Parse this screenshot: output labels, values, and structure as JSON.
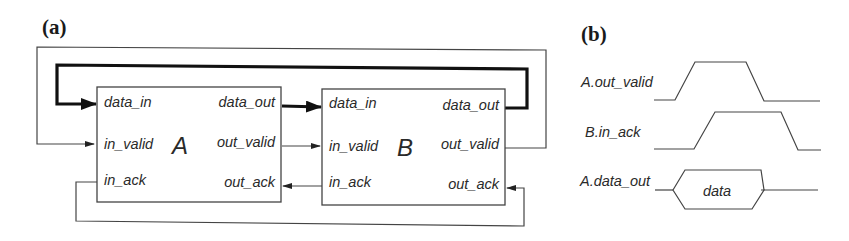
{
  "panels": {
    "a": {
      "label": "(a)",
      "blocks": [
        {
          "name": "A",
          "ports": {
            "data_in": "data_in",
            "data_out": "data_out",
            "in_valid": "in_valid",
            "out_valid": "out_valid",
            "in_ack": "in_ack",
            "out_ack": "out_ack"
          }
        },
        {
          "name": "B",
          "ports": {
            "data_in": "data_in",
            "data_out": "data_out",
            "in_valid": "in_valid",
            "out_valid": "out_valid",
            "in_ack": "in_ack",
            "out_ack": "out_ack"
          }
        }
      ],
      "connections": [
        {
          "from": "A.data_out",
          "to": "B.data_in",
          "style": "thick"
        },
        {
          "from": "B.data_out",
          "to": "A.data_in",
          "style": "thick"
        },
        {
          "from": "A.out_valid",
          "to": "B.in_valid",
          "style": "thin"
        },
        {
          "from": "B.out_valid",
          "to": "A.in_valid",
          "style": "thin"
        },
        {
          "from": "B.in_ack",
          "to": "A.out_ack",
          "style": "thin"
        },
        {
          "from": "A.in_ack",
          "to": "B.out_ack",
          "style": "thin"
        }
      ]
    },
    "b": {
      "label": "(b)",
      "signals": [
        {
          "name": "A.out_valid"
        },
        {
          "name": "B.in_ack"
        },
        {
          "name": "A.data_out",
          "bus_label": "data"
        }
      ]
    }
  },
  "colors": {
    "line": "#444444",
    "thick_line": "#111111",
    "text": "#2a2a2a",
    "background": "#ffffff"
  }
}
